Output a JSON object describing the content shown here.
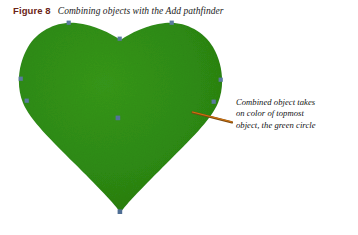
{
  "figure": {
    "number_label": "Figure 8",
    "caption": "Combining objects with the Add pathfinder",
    "number_color": "#6B2417",
    "caption_color": "#1a1a1a",
    "background_color": "#ffffff",
    "width": 358,
    "height": 235
  },
  "artwork": {
    "shape_name": "heart",
    "description": "Green heart shape resulting from combining two circles and a square with the Add pathfinder",
    "fill_color": "#2E8B13",
    "fill_color_dark": "#27770F",
    "anchor_point_color": "#5A7A9E",
    "bounds": {
      "left": 20,
      "top": 22,
      "right": 222,
      "bottom": 213
    },
    "anchor_points": [
      {
        "name": "left-lobe-top",
        "x": 69,
        "y": 23
      },
      {
        "name": "cleft-center",
        "x": 120,
        "y": 39
      },
      {
        "name": "right-lobe-top",
        "x": 172,
        "y": 23
      },
      {
        "name": "left-edge-upper",
        "x": 21,
        "y": 79
      },
      {
        "name": "left-edge-lower",
        "x": 27,
        "y": 101
      },
      {
        "name": "right-edge-upper",
        "x": 221,
        "y": 80
      },
      {
        "name": "right-edge-lower",
        "x": 214,
        "y": 102
      },
      {
        "name": "center-origin",
        "x": 118,
        "y": 118
      },
      {
        "name": "bottom-tip",
        "x": 120,
        "y": 212
      }
    ]
  },
  "leader_line": {
    "name": "callout-leader-line",
    "color": "#C4620C",
    "shadow_color": "#5A3A10",
    "x1": 232,
    "y1": 122,
    "x2": 192,
    "y2": 112,
    "width": 1.4
  },
  "annotation": {
    "lines": [
      "Combined object takes",
      "on color of topmost",
      "object, the green circle"
    ],
    "color": "#111111"
  }
}
